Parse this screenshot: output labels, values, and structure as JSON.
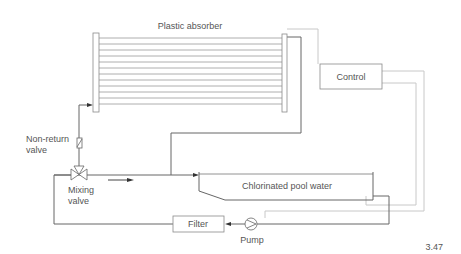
{
  "diagram": {
    "figure_number": "3.47",
    "labels": {
      "absorber": "Plastic absorber",
      "control": "Control",
      "non_return_line1": "Non-return",
      "non_return_line2": "valve",
      "mixing_line1": "Mixing",
      "mixing_line2": "valve",
      "pool": "Chlorinated pool water",
      "filter": "Filter",
      "pump": "Pump"
    },
    "components": [
      {
        "id": "plastic-absorber",
        "type": "solar-collector",
        "tube_count": 12
      },
      {
        "id": "control",
        "type": "controller"
      },
      {
        "id": "non-return-valve",
        "type": "check-valve"
      },
      {
        "id": "mixing-valve",
        "type": "three-way-valve"
      },
      {
        "id": "pool",
        "type": "tank"
      },
      {
        "id": "filter",
        "type": "filter"
      },
      {
        "id": "pump",
        "type": "pump"
      }
    ],
    "connections": [
      {
        "from": "pool",
        "to": "pump",
        "kind": "pipe"
      },
      {
        "from": "pump",
        "to": "filter",
        "kind": "pipe"
      },
      {
        "from": "filter",
        "to": "mixing-valve",
        "kind": "pipe"
      },
      {
        "from": "mixing-valve",
        "to": "non-return-valve",
        "kind": "pipe"
      },
      {
        "from": "non-return-valve",
        "to": "plastic-absorber",
        "kind": "pipe"
      },
      {
        "from": "plastic-absorber",
        "to": "pool",
        "kind": "pipe"
      },
      {
        "from": "mixing-valve",
        "to": "pool",
        "kind": "pipe (bypass)"
      },
      {
        "from": "plastic-absorber",
        "to": "control",
        "kind": "sensor"
      },
      {
        "from": "control",
        "to": "pool",
        "kind": "sensor"
      },
      {
        "from": "control",
        "to": "pump",
        "kind": "signal"
      }
    ],
    "colors": {
      "pipe": "#666666",
      "control_wire": "#c8c8c8",
      "text": "#555555"
    }
  }
}
